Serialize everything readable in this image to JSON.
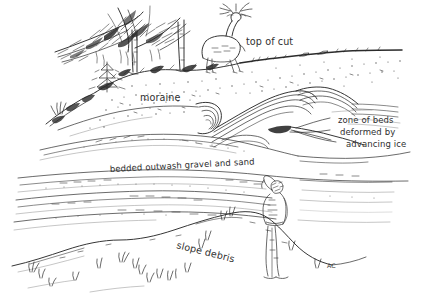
{
  "figure": {
    "kind": "pen-and-ink geological field sketch",
    "medium_note": "black ink line drawing on white paper",
    "background_color": "#ffffff",
    "ink_color": "#2b2b2b",
    "faint_ink_color": "#8d8d8d",
    "width": 425,
    "height": 299
  },
  "labels": {
    "top_of_cut": "top of cut",
    "moraine": "moraine",
    "zone_line1": "zone of beds",
    "zone_line2": "deformed by",
    "zone_line3": "advancing ice",
    "bedded_outwash": "bedded outwash gravel and sand",
    "slope_debris": "slope debris",
    "artist_initials": "AC"
  },
  "scene": {
    "elements": [
      {
        "name": "conifer-branches",
        "description": "sweeping pine branches entering from upper left"
      },
      {
        "name": "tree-trunks",
        "description": "two vertical tree trunks on the moraine crest"
      },
      {
        "name": "small-fir-sapling",
        "description": "small conifer sapling on left slope"
      },
      {
        "name": "deer",
        "description": "antlered deer standing on the ridge at top of cut"
      },
      {
        "name": "human-figure",
        "description": "person standing at base of cut, hand shading eyes, for scale"
      },
      {
        "name": "grass-tufts",
        "description": "scattered grass tufts across lower slope"
      },
      {
        "name": "moraine-till",
        "description": "stippled unsorted till of the moraine"
      },
      {
        "name": "deformed-beds",
        "description": "folded and contorted sediment beds, centre-right"
      },
      {
        "name": "outwash-beds",
        "description": "near-horizontal bedded gravel and sand layers"
      },
      {
        "name": "slope-debris-apron",
        "description": "talus apron at the foot of the exposure"
      }
    ]
  }
}
